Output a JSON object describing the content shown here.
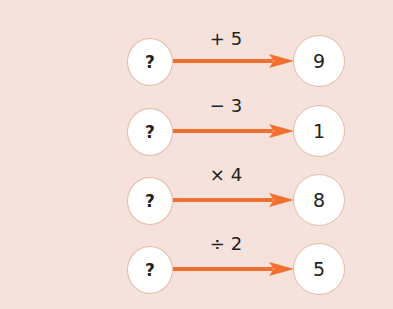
{
  "diagram": {
    "type": "function-machine-arrows",
    "colors": {
      "background": "#f6e2dc",
      "arrow": "#f07030",
      "circle_fill": "#ffffff",
      "circle_border": "#e6b9a6",
      "text": "#231f20"
    },
    "rows": [
      {
        "input": "?",
        "operation": "+ 5",
        "output": "9"
      },
      {
        "input": "?",
        "operation": "− 3",
        "output": "1"
      },
      {
        "input": "?",
        "operation": "× 4",
        "output": "8"
      },
      {
        "input": "?",
        "operation": "÷ 2",
        "output": "5"
      }
    ]
  }
}
